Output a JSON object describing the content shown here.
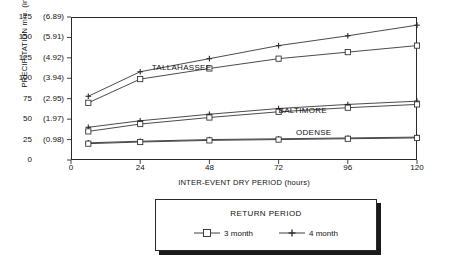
{
  "chart_data": {
    "type": "line",
    "title": "",
    "xlabel": "INTER-EVENT DRY PERIOD (hours)",
    "ylabel": "PRECIPITATION mm. (in.)",
    "xlim": [
      0,
      120
    ],
    "ylim": [
      0,
      175
    ],
    "grid": false,
    "x_ticks": [
      "0",
      "24",
      "48",
      "72",
      "96",
      "120"
    ],
    "x_tick_values": [
      0,
      24,
      48,
      72,
      96,
      120
    ],
    "y_ticks_mm": [
      "0",
      "25",
      "50",
      "75",
      "100",
      "125",
      "150",
      "175"
    ],
    "y_ticks_in": [
      "",
      "(0.98)",
      "(1.97)",
      "(2.95)",
      "(3.94)",
      "(4.92)",
      "(5.91)",
      "(6.89)"
    ],
    "y_tick_values": [
      0,
      25,
      50,
      75,
      100,
      125,
      150,
      175
    ],
    "legend": {
      "title": "RETURN PERIOD",
      "position": "below-plot",
      "entries": [
        {
          "name": "3 month",
          "marker": "open-square"
        },
        {
          "name": "4 month",
          "marker": "plus"
        }
      ]
    },
    "annotations": [
      {
        "text": "TALLAHASSEE",
        "x": 28,
        "y": 112
      },
      {
        "text": "BALTIMORE",
        "x": 72,
        "y": 60
      },
      {
        "text": "ODENSE",
        "x": 78,
        "y": 33
      }
    ],
    "x": [
      6,
      24,
      48,
      72,
      96,
      120
    ],
    "series": [
      {
        "name": "TALLAHASSEE 4 month",
        "group": "TALLAHASSEE",
        "return_period": "4 month",
        "marker": "plus",
        "values": [
          78,
          108,
          124,
          140,
          152,
          165
        ]
      },
      {
        "name": "TALLAHASSEE 3 month",
        "group": "TALLAHASSEE",
        "return_period": "3 month",
        "marker": "open-square",
        "values": [
          70,
          99,
          112,
          124,
          132,
          140
        ]
      },
      {
        "name": "BALTIMORE 4 month",
        "group": "BALTIMORE",
        "return_period": "4 month",
        "marker": "plus",
        "values": [
          40,
          48,
          56,
          63,
          68,
          72
        ]
      },
      {
        "name": "BALTIMORE 3 month",
        "group": "BALTIMORE",
        "return_period": "3 month",
        "marker": "open-square",
        "values": [
          35,
          44,
          52,
          59,
          64,
          68
        ]
      },
      {
        "name": "ODENSE 4 month",
        "group": "ODENSE",
        "return_period": "4 month",
        "marker": "plus",
        "values": [
          21,
          23,
          25,
          26,
          27,
          28
        ]
      },
      {
        "name": "ODENSE 3 month",
        "group": "ODENSE",
        "return_period": "3 month",
        "marker": "open-square",
        "values": [
          20,
          22,
          24,
          25,
          26,
          27
        ]
      }
    ]
  },
  "axes": {
    "y_title": "PRECIPITATION mm. (in.)",
    "x_title": "INTER-EVENT DRY PERIOD (hours)"
  },
  "legend": {
    "title": "RETURN PERIOD",
    "item_3month": "3 month",
    "item_4month": "4 month"
  },
  "labels": {
    "tallahassee": "TALLAHASSEE",
    "baltimore": "BALTIMORE",
    "odense": "ODENSE"
  },
  "colors": {
    "line": "#2a2a2a",
    "frame": "#2a2a2a",
    "shadow": "#1a1a1a",
    "background": "#ffffff"
  }
}
